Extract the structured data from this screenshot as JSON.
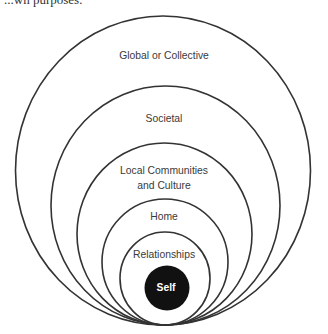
{
  "top_text": "...wn purposes:",
  "diagram": {
    "type": "nested-circles",
    "circles": [
      {
        "label": "Global or Collective"
      },
      {
        "label": "Societal"
      },
      {
        "label_lines": [
          "Local Communities",
          "and Culture"
        ]
      },
      {
        "label": "Home"
      },
      {
        "label": "Relationships"
      },
      {
        "label": "Self"
      }
    ],
    "colors": {
      "stroke": "#333333",
      "center_fill": "#111111",
      "center_text": "#ffffff"
    }
  }
}
